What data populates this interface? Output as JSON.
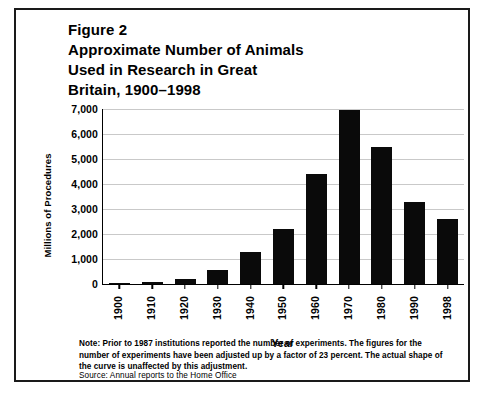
{
  "figure": {
    "title_lines": [
      "Figure 2",
      "Approximate Number of Animals",
      "Used in Research in Great",
      "Britain, 1900–1998"
    ],
    "note": "Note: Prior to 1987 institutions reported the number of experiments. The figures for the number of experiments have been adjusted up by a factor of 23 percent. The actual shape of the curve is unaffected by this adjustment.",
    "source": "Source: Annual reports to the Home Office"
  },
  "chart_data": {
    "type": "bar",
    "title": "Figure 2 Approximate Number of Animals Used in Research in Great Britain, 1900–1998",
    "xlabel": "Year",
    "ylabel": "Millions of Procedures",
    "categories": [
      "1900",
      "1910",
      "1920",
      "1930",
      "1940",
      "1950",
      "1960",
      "1970",
      "1980",
      "1990",
      "1998"
    ],
    "values": [
      60,
      90,
      200,
      550,
      1300,
      2200,
      4400,
      6970,
      5500,
      3300,
      2600
    ],
    "ylim": [
      0,
      7000
    ],
    "yticks": [
      0,
      1000,
      2000,
      3000,
      4000,
      5000,
      6000,
      7000
    ],
    "ytick_labels": [
      "0",
      "1,000",
      "2,000",
      "3,000",
      "4,000",
      "5,000",
      "6,000",
      "7,000"
    ],
    "grid": true,
    "legend": "none",
    "bar_color": "#0a0a0a",
    "grid_color": "#c9c9c9",
    "axis_color": "#000000"
  }
}
